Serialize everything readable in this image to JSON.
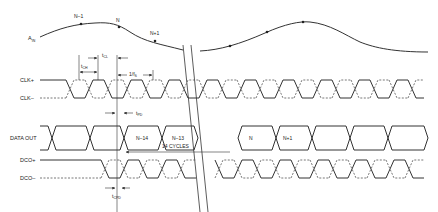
{
  "diagram": {
    "signals": {
      "ain": {
        "label": "A",
        "sub": "IN"
      },
      "clkp": {
        "label": "CLK+"
      },
      "clkm": {
        "label": "CLK–"
      },
      "dataout": {
        "label": "DATA OUT"
      },
      "dcop": {
        "label": "DCO+"
      },
      "dcom": {
        "label": "DCO–"
      }
    },
    "samples": [
      "N–1",
      "N",
      "N+1"
    ],
    "data_words": [
      "N–14",
      "N–13",
      "N",
      "N+1"
    ],
    "timing": {
      "tch": {
        "t": "t",
        "sub": "CH"
      },
      "tcl": {
        "t": "t",
        "sub": "CL"
      },
      "period": {
        "t": "1/f",
        "sub": "S"
      },
      "tpd": {
        "t": "t",
        "sub": "PD"
      },
      "tcpd": {
        "t": "t",
        "sub": "CPD"
      }
    },
    "latency": "14 CYCLES"
  }
}
